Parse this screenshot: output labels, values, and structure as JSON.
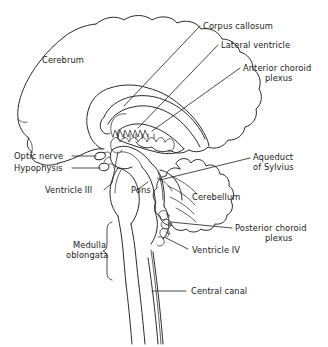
{
  "figure": {
    "kind": "anatomical-line-diagram",
    "background_color": "#ffffff",
    "stroke_color": "#2b2b2b",
    "text_color": "#1a1a1a"
  },
  "labels": {
    "cerebrum": "Cerebrum",
    "corpus_callosum": "Corpus callosum",
    "lateral_ventricle": "Lateral ventricle",
    "anterior_choroid_plexus_line1": "Anterior choroid",
    "anterior_choroid_plexus_line2": "plexus",
    "optic_nerve": "Optic nerve",
    "hypophysis": "Hypophysis",
    "ventricle_iii": "Ventricle III",
    "pons": "Pons",
    "medulla_line1": "Medulla",
    "medulla_line2": "oblongata",
    "aqueduct_line1": "Aqueduct",
    "aqueduct_line2": "of Sylvius",
    "cerebellum": "Cerebellum",
    "posterior_choroid_plexus_line1": "Posterior choroid",
    "posterior_choroid_plexus_line2": "plexus",
    "ventricle_iv": "Ventricle IV",
    "central_canal": "Central canal"
  },
  "structures": [
    "cerebrum",
    "corpus callosum",
    "lateral ventricle",
    "anterior choroid plexus",
    "optic nerve",
    "hypophysis",
    "ventricle III",
    "pons",
    "medulla oblongata",
    "aqueduct of Sylvius",
    "cerebellum",
    "posterior choroid plexus",
    "ventricle IV",
    "central canal"
  ]
}
